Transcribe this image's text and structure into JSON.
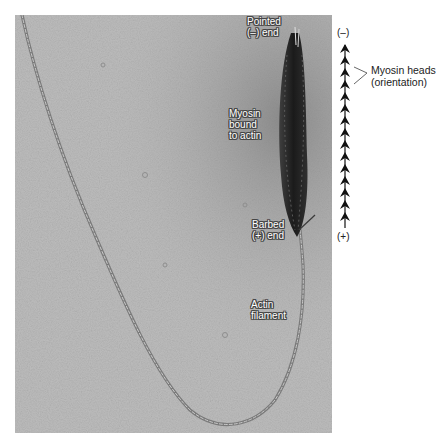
{
  "figure": {
    "type": "electron-micrograph-diagram"
  },
  "labels": {
    "pointed_end": "Pointed\n(–) end",
    "myosin_bound": "Myosin\nbound\nto actin",
    "barbed_end": "Barbed\n(+) end",
    "actin_filament": "Actin\nfilament"
  },
  "polarity_axis": {
    "minus_label": "(–)",
    "plus_label": "(+)",
    "arrowhead_count": 16,
    "arrow_icon": "arrowhead-up-icon",
    "callout_label": "Myosin heads\n(orientation)"
  },
  "colors": {
    "background": "#b9b9b9",
    "myosin_band": "#1e1e1e",
    "filament": "#6e6e6e",
    "axis": "#111111"
  }
}
